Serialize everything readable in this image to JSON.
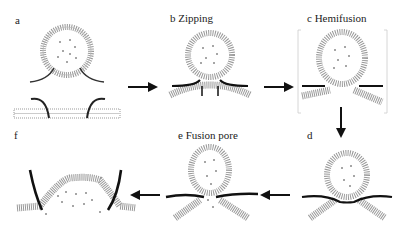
{
  "panels": [
    {
      "id": "a",
      "label": "a",
      "stage": "Docking"
    },
    {
      "id": "b",
      "label": "b Zipping",
      "stage": "Zipping"
    },
    {
      "id": "c",
      "label": "c Hemifusion",
      "stage": "Hemifusion"
    },
    {
      "id": "d",
      "label": "d",
      "stage": "Hemifusion diaphragm"
    },
    {
      "id": "e",
      "label": "e Fusion pore",
      "stage": "Fusion pore"
    },
    {
      "id": "f",
      "label": "f",
      "stage": "Full fusion"
    }
  ],
  "flow": [
    "a",
    "b",
    "c",
    "d",
    "e",
    "f"
  ],
  "colors": {
    "membrane": "#9a9a9a",
    "snare": "#1a1a1a",
    "cargo": "#777777",
    "arrow": "#111111",
    "frame": "#c8c8c8"
  }
}
